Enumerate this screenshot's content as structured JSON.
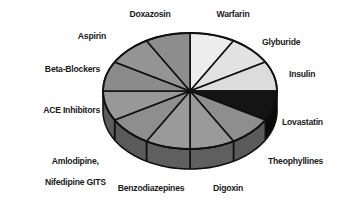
{
  "chart_data": {
    "type": "pie",
    "title": "",
    "subtitle": "",
    "xlabel": "",
    "ylabel": "",
    "legend_position": "none",
    "labels_position": "outside-callout",
    "grid": false,
    "three_d": true,
    "slice_count": 12,
    "categories": [
      "Warfarin",
      "Glyburide",
      "Insulin",
      "Lovastatin",
      "Theophyllines",
      "Digoxin",
      "Benzodiazepines",
      "Amlodipine,\nNifedipine GITS",
      "ACE Inhibitors",
      "Beta-Blockers",
      "Aspirin",
      "Doxazosin"
    ],
    "values": [
      8.33,
      8.33,
      8.33,
      8.33,
      8.33,
      8.33,
      8.33,
      8.33,
      8.33,
      8.33,
      8.33,
      8.33
    ],
    "slices": [
      {
        "label": "Warfarin",
        "value": 8.33,
        "start_angle": 0,
        "end_angle": 30,
        "color": "#ededed",
        "side_color": "#bdbdbd"
      },
      {
        "label": "Glyburide",
        "value": 8.33,
        "start_angle": 30,
        "end_angle": 60,
        "color": "#e2e2e2",
        "side_color": "#b4b4b4"
      },
      {
        "label": "Insulin",
        "value": 8.33,
        "start_angle": 60,
        "end_angle": 90,
        "color": "#dcdcdc",
        "side_color": "#ababab"
      },
      {
        "label": "Lovastatin",
        "value": 8.33,
        "start_angle": 90,
        "end_angle": 120,
        "color": "#141414",
        "side_color": "#0b0b0b"
      },
      {
        "label": "Theophyllines",
        "value": 8.33,
        "start_angle": 120,
        "end_angle": 150,
        "color": "#8e8e8e",
        "side_color": "#5a5a5a"
      },
      {
        "label": "Digoxin",
        "value": 8.33,
        "start_angle": 150,
        "end_angle": 180,
        "color": "#9a9a9a",
        "side_color": "#5f5f5f"
      },
      {
        "label": "Benzodiazepines",
        "value": 8.33,
        "start_angle": 180,
        "end_angle": 210,
        "color": "#9a9a9a",
        "side_color": "#5f5f5f"
      },
      {
        "label": "Amlodipine,\nNifedipine GITS",
        "value": 8.33,
        "start_angle": 210,
        "end_angle": 240,
        "color": "#8e8e8e",
        "side_color": "#5a5a5a"
      },
      {
        "label": "ACE Inhibitors",
        "value": 8.33,
        "start_angle": 240,
        "end_angle": 270,
        "color": "#989898",
        "side_color": "#5d5d5d"
      },
      {
        "label": "Beta-Blockers",
        "value": 8.33,
        "start_angle": 270,
        "end_angle": 300,
        "color": "#8b8b8b",
        "side_color": "#585858"
      },
      {
        "label": "Aspirin",
        "value": 8.33,
        "start_angle": 300,
        "end_angle": 330,
        "color": "#949494",
        "side_color": "#5c5c5c"
      },
      {
        "label": "Doxazosin",
        "value": 8.33,
        "start_angle": 330,
        "end_angle": 360,
        "color": "#8d8d8d",
        "side_color": "#5a5a5a"
      }
    ],
    "geometry": {
      "center_x": 190,
      "center_y": 91,
      "radius_x": 87,
      "radius_y": 58,
      "depth": 20
    },
    "style": {
      "background": "#ffffff",
      "outline": "#101010",
      "label_color": "#1a1a1a"
    }
  },
  "labels": {
    "doxazosin": "Doxazosin",
    "warfarin": "Warfarin",
    "aspirin": "Aspirin",
    "glyburide": "Glyburide",
    "beta_blockers": "Beta-Blockers",
    "insulin": "Insulin",
    "ace_inhibitors": "ACE Inhibitors",
    "lovastatin": "Lovastatin",
    "amlodipine_line1": "Amlodipine,",
    "amlodipine_line2": "Nifedipine GITS",
    "theophyllines": "Theophyllines",
    "benzodiazepines": "Benzodiazepines",
    "digoxin": "Digoxin"
  }
}
